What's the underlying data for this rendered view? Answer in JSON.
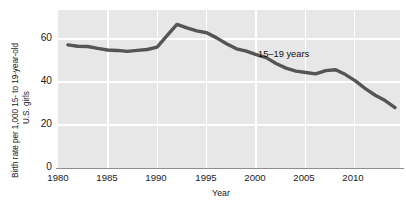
{
  "chart_data": {
    "type": "line",
    "title": "",
    "xlabel": "Year",
    "ylabel": "Birth rate per 1,000 15- to 19-year-old U.S. girls",
    "ylabel_lines": [
      "Birth rate per 1,000 15- to 19-year-old",
      "U.S. girls"
    ],
    "xlim": [
      1979,
      2013.5
    ],
    "ylim": [
      0,
      68
    ],
    "yticks": [
      "0",
      "20",
      "40",
      "60"
    ],
    "ytick_values": [
      0,
      20,
      40,
      60
    ],
    "xticks": [
      "1980",
      "1985",
      "1990",
      "1995",
      "2000",
      "2005",
      "2010"
    ],
    "xtick_values": [
      1980,
      1985,
      1990,
      1995,
      2000,
      2005,
      2010
    ],
    "grid": true,
    "grid_color": "#ffffff",
    "plot_background": "#e7e7e7",
    "legend_position": "inline-annotation",
    "series": [
      {
        "name": "15–19 years",
        "color": "#555555",
        "line_width": 3.4,
        "annotation": "15–19 years",
        "x": [
          1980,
          1981,
          1982,
          1983,
          1984,
          1985,
          1986,
          1987,
          1988,
          1989,
          1990,
          1991,
          1992,
          1993,
          1994,
          1995,
          1996,
          1997,
          1998,
          1999,
          2000,
          2001,
          2002,
          2003,
          2004,
          2005,
          2006,
          2007,
          2008,
          2009,
          2010,
          2011,
          2012,
          2013
        ],
        "values": [
          53.0,
          52.4,
          52.3,
          51.5,
          50.8,
          50.6,
          50.2,
          50.6,
          51.0,
          52.0,
          57.0,
          61.8,
          60.3,
          59.0,
          58.2,
          56.0,
          53.5,
          51.3,
          50.3,
          48.8,
          47.5,
          45.0,
          43.0,
          41.7,
          41.1,
          40.5,
          41.9,
          42.3,
          40.2,
          37.5,
          34.2,
          31.3,
          29.0,
          26.0
        ]
      }
    ]
  },
  "axes": {
    "ylabel_line1": "Birth rate per 1,000 15- to 19-year-old",
    "ylabel_line2": "U.S. girls",
    "xlabel": "Year",
    "ytick_0": "0",
    "ytick_1": "20",
    "ytick_2": "40",
    "ytick_3": "60",
    "xtick_0": "1980",
    "xtick_1": "1985",
    "xtick_2": "1990",
    "xtick_3": "1995",
    "xtick_4": "2000",
    "xtick_5": "2005",
    "xtick_6": "2010"
  },
  "annotations": {
    "series_label": "15–19 years"
  }
}
